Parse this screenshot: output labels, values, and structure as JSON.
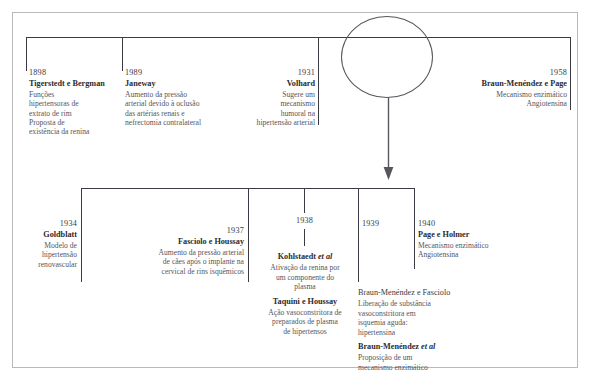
{
  "diagram": {
    "accent_color": "#3b3b44",
    "frame_color": "#b9b9b9",
    "text_color": "#3a3a3f",
    "marker_color": "#56565e"
  },
  "top_timeline": {
    "entries": [
      {
        "year": "1898",
        "who": "Tigerstedt e Bergman",
        "what": "Funções\nhipertensoras de\nextrato de rim\nProposta de\nexistência da renina",
        "align": "left"
      },
      {
        "year": "1989",
        "who": "Janeway",
        "what": "Aumento da pressão\narterial devido à oclusão\ndas artérias renais e\nnefrectomia contralateral",
        "align": "left"
      },
      {
        "year": "1931",
        "who": "Volhard",
        "what": "Sugere um\nmecanismo\nhumoral na\nhipertensão arterial",
        "align": "right"
      },
      {
        "year": "1958",
        "who": "Braun-Menéndez e Page",
        "what": "Mecanismo enzimático\nAngiotensina",
        "align": "right"
      }
    ]
  },
  "bottom_timeline": {
    "entries": [
      {
        "year": "1934",
        "who": "Goldblatt",
        "what": "Modelo de\nhipertensão\nrenovascular",
        "align": "right"
      },
      {
        "year": "1937",
        "who": "Fasciolo e Houssay",
        "what": "Aumento da pressão arterial\nde cães após o implante na\ncervical de rins isquêmicos",
        "align": "right"
      },
      {
        "year": "1938",
        "who": "",
        "what": "",
        "align": "center"
      },
      {
        "year": "1939",
        "who": "",
        "what": "",
        "align": "left"
      },
      {
        "year": "1940",
        "who": "Page e Holmer",
        "what": "Mecanismo enzimático\nAngiotensina",
        "align": "left"
      }
    ],
    "sub_blocks": {
      "y1938": [
        {
          "who": "Kohlstaedt ",
          "who_italic": "et al",
          "bold": true,
          "what": "Ativação da renina por\num componente do\nplasma"
        },
        {
          "who": "Taquini e Houssay",
          "who_italic": "",
          "bold": true,
          "what": "Ação vasoconstritora de\npreparados de plasma\nde hipertensos"
        }
      ],
      "y1939": [
        {
          "who": "Braun-Menéndez e Fasciolo",
          "who_italic": "",
          "bold": false,
          "what": "Liberação de substância\nvasoconstritora em\nisquemia aguda:\nhipertensina"
        },
        {
          "who": "Braun-Menéndez ",
          "who_italic": "et al",
          "bold": true,
          "what": "Proposição de um\nmecanismo enzimático"
        }
      ]
    }
  },
  "markers": {
    "ellipse_label": "highlight-ellipse",
    "arrow_label": "downward-arrow"
  }
}
